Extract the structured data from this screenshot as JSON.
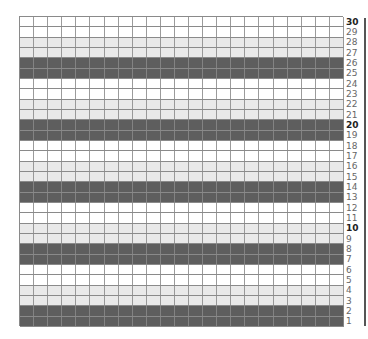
{
  "chart": {
    "rows": 30,
    "columns": 23,
    "colors": {
      "dark": "#5e5e5e",
      "light": "#e9e9e9",
      "white": "#ffffff",
      "grid": "#8a8a8a"
    },
    "row_pattern_from_bottom": [
      "dark",
      "dark",
      "light",
      "light",
      "white",
      "white"
    ],
    "row_labels": [
      "1",
      "2",
      "3",
      "4",
      "5",
      "6",
      "7",
      "8",
      "9",
      "10",
      "11",
      "12",
      "13",
      "14",
      "15",
      "16",
      "17",
      "18",
      "19",
      "20",
      "21",
      "22",
      "23",
      "24",
      "25",
      "26",
      "27",
      "28",
      "29",
      "30"
    ],
    "bold_labels": [
      "10",
      "20",
      "30"
    ]
  }
}
